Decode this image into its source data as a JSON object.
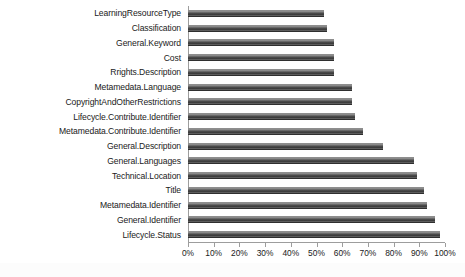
{
  "chart_data": {
    "type": "bar",
    "orientation": "horizontal",
    "title": "",
    "subtitle": "",
    "xlabel": "",
    "ylabel": "",
    "xlim": [
      0,
      100
    ],
    "xtick_labels": [
      "0%",
      "10%",
      "20%",
      "30%",
      "40%",
      "50%",
      "60%",
      "70%",
      "80%",
      "90%",
      "100%"
    ],
    "xtick_values": [
      0,
      10,
      20,
      30,
      40,
      50,
      60,
      70,
      80,
      90,
      100
    ],
    "grid": false,
    "legend": null,
    "legend_position": "none",
    "bar_color": "#4a4a4a",
    "categories": [
      "LearningResourceType",
      "Classification",
      "General.Keyword",
      "Cost",
      "Rrights.Description",
      "Metamedata.Language",
      "CopyrightAndOtherRestrictions",
      "Lifecycle.Contribute.Identifier",
      "Metamedata.Contribute.Identifier",
      "General.Description",
      "General.Languages",
      "Technical.Location",
      "Title",
      "Metamedata.Identifier",
      "General.Identifier",
      "Lifecycle.Status"
    ],
    "values": [
      53,
      54,
      57,
      57,
      57,
      64,
      64,
      65,
      68,
      76,
      88,
      89,
      92,
      93,
      96,
      98
    ]
  }
}
